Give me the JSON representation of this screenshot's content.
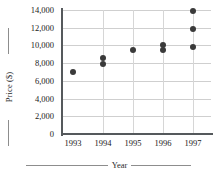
{
  "chart_data": {
    "type": "scatter",
    "title": "",
    "xlabel": "Year",
    "ylabel": "Price ($)",
    "xlim": [
      1992.6,
      1997.6
    ],
    "ylim": [
      0,
      14000
    ],
    "grid": true,
    "legend": null,
    "ytick_labels": [
      "14,000",
      "12,000",
      "10,000",
      "8,000",
      "6,000",
      "4,000",
      "2,000",
      "0"
    ],
    "ytick_values": [
      14000,
      12000,
      10000,
      8000,
      6000,
      4000,
      2000,
      0
    ],
    "xtick_labels": [
      "1993",
      "1994",
      "1995",
      "1996",
      "1997"
    ],
    "xtick_values": [
      1993,
      1994,
      1995,
      1996,
      1997
    ],
    "points": [
      {
        "x": 1993,
        "y": 7000
      },
      {
        "x": 1994,
        "y": 8600
      },
      {
        "x": 1994,
        "y": 7900
      },
      {
        "x": 1995,
        "y": 9500
      },
      {
        "x": 1996,
        "y": 10100
      },
      {
        "x": 1996,
        "y": 9500
      },
      {
        "x": 1997,
        "y": 13900
      },
      {
        "x": 1997,
        "y": 11800
      },
      {
        "x": 1997,
        "y": 9800
      }
    ],
    "marker_color": "#3a3a3a",
    "grid_color": "#cfcfcf",
    "axis_color": "#55595c"
  }
}
